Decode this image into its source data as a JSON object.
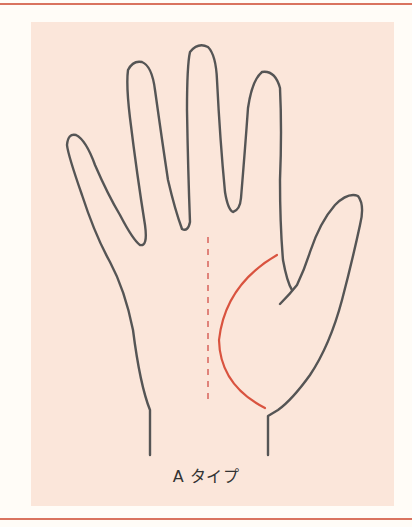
{
  "figure": {
    "label": "A タイプ",
    "colors": {
      "rule": "#d9735f",
      "panel": "#fbe6da",
      "outline": "#555555",
      "palm_line": "#d9533f",
      "guide_line": "#e0837a"
    },
    "elements": [
      {
        "name": "hand-outline",
        "description": "Outline of an open right palm with five fingers"
      },
      {
        "name": "life-line",
        "description": "Red curved line around the thumb base"
      },
      {
        "name": "center-guide",
        "description": "Dashed vertical guide line down the middle of the palm"
      }
    ]
  }
}
